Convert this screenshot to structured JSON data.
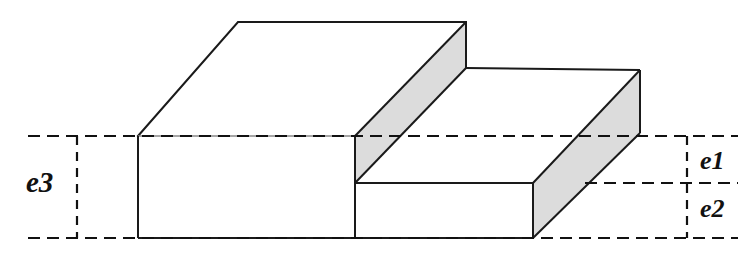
{
  "figure": {
    "type": "isometric-solid",
    "background_color": "#ffffff",
    "outline_color": "#1a1a1a",
    "shade_color": "#dcdcdc",
    "dimension_line_color": "#111111"
  },
  "labels": {
    "e1": "e1",
    "e2": "e2",
    "e3": "e3"
  },
  "dimensions": [
    {
      "name": "e3",
      "label": "e3",
      "side": "left",
      "description": "Total thickness of the thick (left) portion of the slab",
      "from_y": 136,
      "to_y": 238
    },
    {
      "name": "e1",
      "label": "e1",
      "side": "right",
      "description": "Thickness of the upper step removed from the thin portion",
      "from_y": 136,
      "to_y": 183
    },
    {
      "name": "e2",
      "label": "e2",
      "side": "right",
      "description": "Thickness of the thin (right) portion of the slab",
      "from_y": 183,
      "to_y": 238
    }
  ],
  "geometry": {
    "upper_top_face": "138,136 238,22 466,22 355,136",
    "upper_front_face": "138,136 355,136 355,238 138,238",
    "step_riser_face": "355,136 466,22 466,68 355,183",
    "lower_top_face": "355,183 466,68 640,70 533,183",
    "lower_front_face": "355,183 533,183 533,238 355,238",
    "lower_right_face": "533,183 640,70 640,133 533,238"
  },
  "shaded_faces": [
    "step_riser_face",
    "lower_right_face"
  ]
}
